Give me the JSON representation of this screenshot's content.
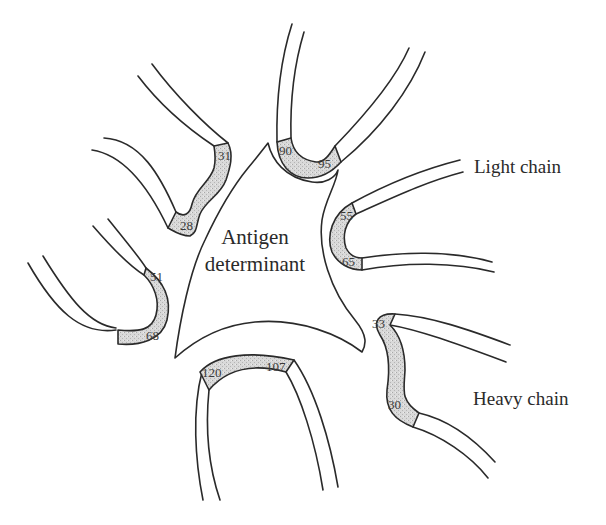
{
  "figure": {
    "center_label": {
      "line1": "Antigen",
      "line2": "determinant"
    },
    "chain_labels": {
      "light": "Light chain",
      "heavy": "Heavy chain"
    },
    "hypervariable_regions": [
      {
        "id": "hv-28-31",
        "start": "28",
        "end": "31"
      },
      {
        "id": "hv-90-95",
        "start": "90",
        "end": "95"
      },
      {
        "id": "hv-55-65",
        "start": "55",
        "end": "65"
      },
      {
        "id": "hv-51-68",
        "start": "51",
        "end": "68"
      },
      {
        "id": "hv-107-120",
        "start": "107",
        "end": "120"
      },
      {
        "id": "hv-30-33",
        "start": "30",
        "end": "33"
      }
    ],
    "colors": {
      "line": "#2a2a2a",
      "stipple": "#cfcfcf",
      "background": "#ffffff"
    }
  }
}
